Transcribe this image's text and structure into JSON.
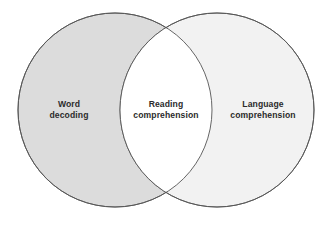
{
  "diagram": {
    "type": "venn-two-set",
    "background_color": "#ffffff",
    "stroke_color": "#555555",
    "stroke_width": 0.9,
    "text_color": "#2b2b2b",
    "sets": [
      {
        "id": "left",
        "label": "Word\ndecoding",
        "label_line1": "Word",
        "label_line2": "decoding",
        "fill_color": "#dcdcdc",
        "center_x": 115,
        "center_y": 110,
        "radius": 97
      },
      {
        "id": "right",
        "label": "Language\ncomprehension",
        "label_line1": "Language",
        "label_line2": "comprehension",
        "fill_color": "#f2f2f2",
        "center_x": 217,
        "center_y": 110,
        "radius": 97
      }
    ],
    "intersection": {
      "id": "center",
      "label": "Reading\ncomprehension",
      "label_line1": "Reading",
      "label_line2": "comprehension",
      "fill_color": "#ffffff"
    }
  }
}
